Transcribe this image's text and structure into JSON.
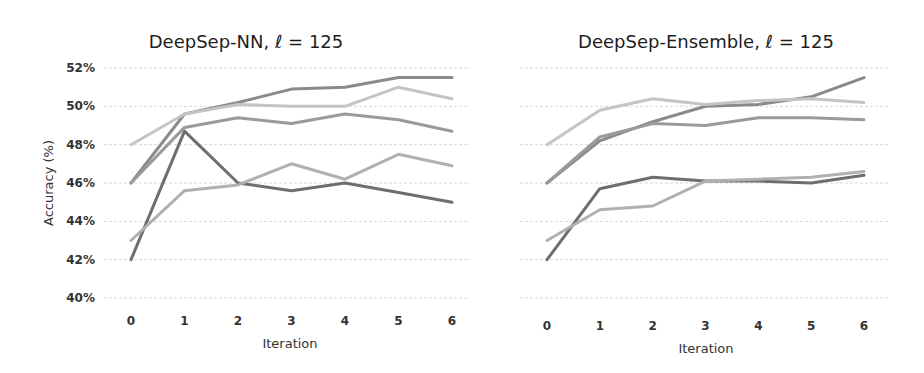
{
  "chart_data": [
    {
      "type": "line",
      "title": "DeepSep-NN, ℓ = 125",
      "xlabel": "Iteration",
      "ylabel": "Accuracy (%)",
      "x": [
        0,
        1,
        2,
        3,
        4,
        5,
        6
      ],
      "ylim": [
        40,
        52
      ],
      "yticks": [
        "40%",
        "42%",
        "44%",
        "46%",
        "48%",
        "50%",
        "52%"
      ],
      "grid": true,
      "legend": null,
      "series": [
        {
          "name": "series-1",
          "color": "#8a8a8a",
          "values": [
            46.0,
            49.6,
            50.2,
            50.9,
            51.0,
            51.5,
            51.5
          ]
        },
        {
          "name": "series-2",
          "color": "#c4c4c4",
          "values": [
            48.0,
            49.6,
            50.1,
            50.0,
            50.0,
            51.0,
            50.4
          ]
        },
        {
          "name": "series-3",
          "color": "#9a9a9a",
          "values": [
            46.0,
            48.9,
            49.4,
            49.1,
            49.6,
            49.3,
            48.7
          ]
        },
        {
          "name": "series-4",
          "color": "#6e6e6e",
          "values": [
            42.0,
            48.7,
            46.0,
            45.6,
            46.0,
            45.5,
            45.0
          ]
        },
        {
          "name": "series-5",
          "color": "#b0b0b0",
          "values": [
            43.0,
            45.6,
            45.9,
            47.0,
            46.2,
            47.5,
            46.9
          ]
        }
      ]
    },
    {
      "type": "line",
      "title": "DeepSep-Ensemble, ℓ = 125",
      "xlabel": "Iteration",
      "ylabel": "",
      "x": [
        0,
        1,
        2,
        3,
        4,
        5,
        6
      ],
      "ylim": [
        40,
        52
      ],
      "yticks": [],
      "grid": true,
      "legend": null,
      "series": [
        {
          "name": "series-1",
          "color": "#8a8a8a",
          "values": [
            46.0,
            48.2,
            49.2,
            50.0,
            50.1,
            50.5,
            51.5
          ]
        },
        {
          "name": "series-2",
          "color": "#c4c4c4",
          "values": [
            48.0,
            49.8,
            50.4,
            50.1,
            50.3,
            50.4,
            50.2
          ]
        },
        {
          "name": "series-3",
          "color": "#9a9a9a",
          "values": [
            46.0,
            48.4,
            49.1,
            49.0,
            49.4,
            49.4,
            49.3
          ]
        },
        {
          "name": "series-4",
          "color": "#6e6e6e",
          "values": [
            42.0,
            45.7,
            46.3,
            46.1,
            46.1,
            46.0,
            46.4
          ]
        },
        {
          "name": "series-5",
          "color": "#b0b0b0",
          "values": [
            43.0,
            44.6,
            44.8,
            46.1,
            46.2,
            46.3,
            46.6
          ]
        }
      ]
    }
  ]
}
